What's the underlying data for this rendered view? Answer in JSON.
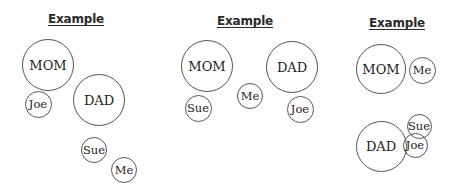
{
  "diagrams": [
    {
      "title": "Example",
      "title_x": 76,
      "title_y": 12,
      "people": [
        {
          "label": "MOM",
          "cx": 48,
          "cy": 65,
          "r": 26,
          "size": "big"
        },
        {
          "label": "Joe",
          "cx": 38,
          "cy": 104,
          "r": 13.5,
          "size": "small"
        },
        {
          "label": "DAD",
          "cx": 99,
          "cy": 100,
          "r": 26,
          "size": "big"
        },
        {
          "label": "Sue",
          "cx": 94,
          "cy": 150,
          "r": 13,
          "size": "small"
        },
        {
          "label": "Me",
          "cx": 124,
          "cy": 170,
          "r": 13,
          "size": "small"
        }
      ]
    },
    {
      "title": "Example",
      "title_x": 245,
      "title_y": 14,
      "people": [
        {
          "label": "MOM",
          "cx": 207,
          "cy": 66,
          "r": 26,
          "size": "big"
        },
        {
          "label": "DAD",
          "cx": 292,
          "cy": 67,
          "r": 26,
          "size": "big"
        },
        {
          "label": "Me",
          "cx": 250,
          "cy": 96,
          "r": 13,
          "size": "small"
        },
        {
          "label": "Sue",
          "cx": 198,
          "cy": 108,
          "r": 13.5,
          "size": "small"
        },
        {
          "label": "Joe",
          "cx": 300,
          "cy": 109,
          "r": 13.5,
          "size": "small"
        }
      ]
    },
    {
      "title": "Example",
      "title_x": 397,
      "title_y": 16,
      "people": [
        {
          "label": "MOM",
          "cx": 381,
          "cy": 69,
          "r": 25,
          "size": "big"
        },
        {
          "label": "Me",
          "cx": 422,
          "cy": 70,
          "r": 13.5,
          "size": "small"
        },
        {
          "label": "DAD",
          "cx": 381,
          "cy": 146,
          "r": 25.5,
          "size": "big"
        },
        {
          "label": "Sue",
          "cx": 419,
          "cy": 126,
          "r": 12.5,
          "size": "small"
        },
        {
          "label": "Joe",
          "cx": 415,
          "cy": 145,
          "r": 12.5,
          "size": "small"
        }
      ]
    }
  ]
}
